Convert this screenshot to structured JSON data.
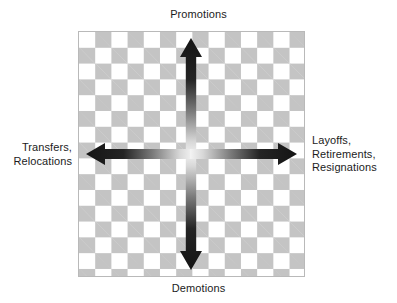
{
  "diagram": {
    "title_top": "Promotions",
    "title_bottom": "Demotions",
    "title_left": "Transfers,\nRelocations",
    "title_right": "Layoffs,\nRetirements,\nResignations",
    "colors": {
      "checker_light": "#ffffff",
      "checker_dark": "#c4c4c4",
      "panel_border": "#b9b9b9",
      "arrow_dark": "#1a1a1a",
      "arrow_center": "#f2f2f2",
      "text": "#1c1c1c"
    },
    "arrows": [
      {
        "name": "up-arrow",
        "direction": "up",
        "points_to": "Promotions"
      },
      {
        "name": "down-arrow",
        "direction": "down",
        "points_to": "Demotions"
      },
      {
        "name": "left-arrow",
        "direction": "left",
        "points_to": "Transfers, Relocations"
      },
      {
        "name": "right-arrow",
        "direction": "right",
        "points_to": "Layoffs, Retirements, Resignations"
      }
    ]
  }
}
